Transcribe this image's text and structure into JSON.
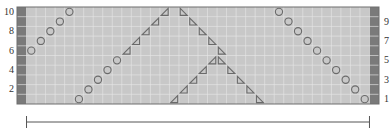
{
  "chart_data": {
    "type": "table",
    "title": "",
    "grid": {
      "columns": 38,
      "rows": 10,
      "edge_columns_shaded": [
        0,
        37
      ]
    },
    "row_labels_left": [
      "2",
      "4",
      "6",
      "8",
      "10"
    ],
    "row_labels_right": [
      "1",
      "3",
      "5",
      "7",
      "9"
    ],
    "symbols": {
      "circle": [
        {
          "row": 6,
          "col": 1
        },
        {
          "row": 7,
          "col": 2
        },
        {
          "row": 8,
          "col": 3
        },
        {
          "row": 9,
          "col": 4
        },
        {
          "row": 10,
          "col": 5
        },
        {
          "row": 1,
          "col": 6
        },
        {
          "row": 2,
          "col": 7
        },
        {
          "row": 3,
          "col": 8
        },
        {
          "row": 4,
          "col": 9
        },
        {
          "row": 5,
          "col": 10
        },
        {
          "row": 10,
          "col": 27
        },
        {
          "row": 9,
          "col": 28
        },
        {
          "row": 8,
          "col": 29
        },
        {
          "row": 7,
          "col": 30
        },
        {
          "row": 6,
          "col": 31
        },
        {
          "row": 5,
          "col": 32
        },
        {
          "row": 4,
          "col": 33
        },
        {
          "row": 3,
          "col": 34
        },
        {
          "row": 2,
          "col": 35
        },
        {
          "row": 1,
          "col": 36
        }
      ],
      "triangle_left": [
        {
          "row": 6,
          "col": 11
        },
        {
          "row": 7,
          "col": 12
        },
        {
          "row": 8,
          "col": 13
        },
        {
          "row": 9,
          "col": 14
        },
        {
          "row": 10,
          "col": 15
        },
        {
          "row": 1,
          "col": 16
        },
        {
          "row": 2,
          "col": 17
        },
        {
          "row": 3,
          "col": 18
        },
        {
          "row": 4,
          "col": 19
        },
        {
          "row": 5,
          "col": 20
        }
      ],
      "triangle_right": [
        {
          "row": 10,
          "col": 17
        },
        {
          "row": 9,
          "col": 18
        },
        {
          "row": 8,
          "col": 19
        },
        {
          "row": 7,
          "col": 20
        },
        {
          "row": 6,
          "col": 21
        },
        {
          "row": 5,
          "col": 21
        },
        {
          "row": 4,
          "col": 22
        },
        {
          "row": 3,
          "col": 23
        },
        {
          "row": 2,
          "col": 24
        },
        {
          "row": 1,
          "col": 25
        }
      ]
    },
    "measure_bar": {
      "from_col": 1,
      "to_col": 36
    }
  },
  "colors": {
    "cell": "#c8c8c8",
    "grid_line": "#e6e6e6",
    "edge_column": "#7a7a7a",
    "border": "#6e6e6e",
    "symbol": "#6a6a6a",
    "label": "#333333",
    "measure_line": "#555555"
  }
}
